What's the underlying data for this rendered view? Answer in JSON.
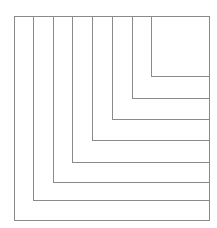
{
  "diagram": {
    "type": "nested-rectangles-staircase",
    "stroke_color": "#8a8a8a",
    "background": "#ffffff",
    "outer_box": {
      "x": 14,
      "y": 16,
      "width": 195,
      "height": 204
    },
    "vertical_lines": [
      {
        "x": 33,
        "y1": 16,
        "y2": 200
      },
      {
        "x": 53,
        "y1": 16,
        "y2": 182
      },
      {
        "x": 72,
        "y1": 16,
        "y2": 162
      },
      {
        "x": 92,
        "y1": 16,
        "y2": 140
      },
      {
        "x": 112,
        "y1": 16,
        "y2": 119
      },
      {
        "x": 132,
        "y1": 16,
        "y2": 98
      },
      {
        "x": 151,
        "y1": 16,
        "y2": 76
      }
    ],
    "horizontal_lines": [
      {
        "y": 76,
        "x1": 151,
        "x2": 209
      },
      {
        "y": 98,
        "x1": 132,
        "x2": 209
      },
      {
        "y": 119,
        "x1": 112,
        "x2": 209
      },
      {
        "y": 140,
        "x1": 92,
        "x2": 209
      },
      {
        "y": 162,
        "x1": 72,
        "x2": 209
      },
      {
        "y": 182,
        "x1": 53,
        "x2": 209
      },
      {
        "y": 200,
        "x1": 33,
        "x2": 209
      }
    ]
  }
}
